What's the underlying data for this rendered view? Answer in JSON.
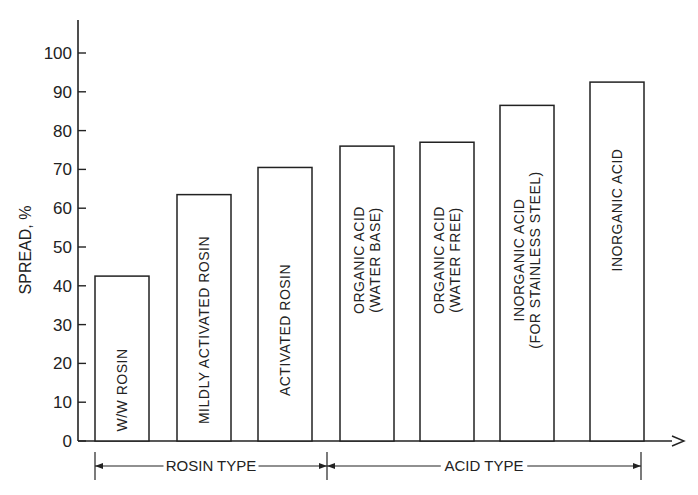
{
  "chart_data": {
    "type": "bar",
    "title": "",
    "xlabel": "",
    "ylabel": "SPREAD, %",
    "ylim": [
      0,
      100
    ],
    "yticks": [
      0,
      10,
      20,
      30,
      40,
      50,
      60,
      70,
      80,
      90,
      100
    ],
    "grid": false,
    "legend": null,
    "categories": [
      [
        "W/W ROSIN"
      ],
      [
        "MILDLY ACTIVATED ROSIN"
      ],
      [
        "ACTIVATED ROSIN"
      ],
      [
        "ORGANIC ACID",
        "(WATER BASE)"
      ],
      [
        "ORGANIC ACID",
        "(WATER FREE)"
      ],
      [
        "INORGANIC ACID",
        "(FOR STAINLESS STEEL)"
      ],
      [
        "INORGANIC ACID"
      ]
    ],
    "values": [
      42.5,
      63.5,
      70.5,
      76,
      77,
      86.5,
      92.5
    ],
    "groups": [
      {
        "label": "ROSIN TYPE",
        "categories": [
          0,
          1,
          2
        ]
      },
      {
        "label": "ACID TYPE",
        "categories": [
          3,
          4,
          5,
          6
        ]
      }
    ]
  }
}
